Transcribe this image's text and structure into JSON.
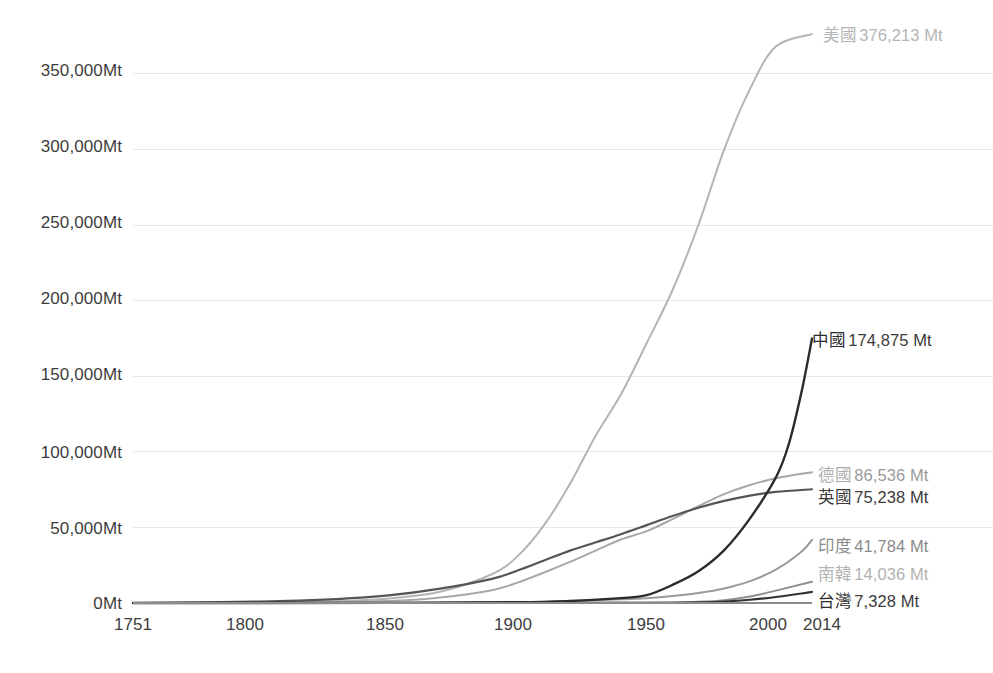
{
  "chart_data": {
    "type": "line",
    "title": "",
    "subtitle": "",
    "xlabel": "",
    "ylabel": "",
    "unit": "Mt",
    "xlim": [
      1751,
      2014
    ],
    "ylim": [
      0,
      380000
    ],
    "grid": true,
    "legend_position": "right-inline-end-labels",
    "y_ticks": [
      {
        "value": 0,
        "label": "0Mt"
      },
      {
        "value": 50000,
        "label": "50,000Mt"
      },
      {
        "value": 100000,
        "label": "100,000Mt"
      },
      {
        "value": 150000,
        "label": "150,000Mt"
      },
      {
        "value": 200000,
        "label": "200,000Mt"
      },
      {
        "value": 250000,
        "label": "250,000Mt"
      },
      {
        "value": 300000,
        "label": "300,000Mt"
      },
      {
        "value": 350000,
        "label": "350,000Mt"
      }
    ],
    "x_ticks": [
      {
        "value": 1751,
        "label": "1751"
      },
      {
        "value": 1800,
        "label": "1800"
      },
      {
        "value": 1850,
        "label": "1850"
      },
      {
        "value": 1900,
        "label": "1900"
      },
      {
        "value": 1950,
        "label": "1950"
      },
      {
        "value": 2000,
        "label": "2000"
      },
      {
        "value": 2014,
        "label": "2014"
      }
    ],
    "series": [
      {
        "name": "美國",
        "end_label_name": "美國",
        "end_label_value": "376,213 Mt",
        "final_value": 376213,
        "color": "#b4b4b4",
        "stroke_width": 2.0,
        "x": [
          1751,
          1800,
          1830,
          1850,
          1870,
          1890,
          1900,
          1910,
          1920,
          1930,
          1940,
          1950,
          1960,
          1970,
          1980,
          1990,
          2000,
          2014
        ],
        "values": [
          0,
          300,
          1200,
          3000,
          7500,
          19000,
          31000,
          51000,
          78000,
          110000,
          138000,
          172000,
          207000,
          250000,
          300000,
          340000,
          368000,
          376213
        ]
      },
      {
        "name": "中國",
        "end_label_name": "中國",
        "end_label_value": "174,875 Mt",
        "final_value": 174875,
        "color": "#2b2b2b",
        "stroke_width": 2.4,
        "x": [
          1751,
          1850,
          1900,
          1920,
          1940,
          1950,
          1960,
          1970,
          1980,
          1990,
          2000,
          2005,
          2010,
          2014
        ],
        "values": [
          0,
          80,
          500,
          1300,
          3200,
          5200,
          12000,
          21000,
          35000,
          56000,
          83000,
          105000,
          140000,
          174875
        ]
      },
      {
        "name": "德國",
        "end_label_name": "德國",
        "end_label_value": "86,536 Mt",
        "final_value": 86536,
        "color": "#a8a8a8",
        "stroke_width": 2.0,
        "x": [
          1751,
          1800,
          1850,
          1870,
          1890,
          1900,
          1910,
          1920,
          1930,
          1940,
          1950,
          1960,
          1970,
          1980,
          1990,
          2000,
          2014
        ],
        "values": [
          0,
          200,
          1400,
          3600,
          8500,
          13500,
          20000,
          27000,
          34500,
          42000,
          47500,
          55500,
          64000,
          72000,
          78000,
          82500,
          86536
        ]
      },
      {
        "name": "英國",
        "end_label_name": "英國",
        "end_label_value": "75,238 Mt",
        "final_value": 75238,
        "color": "#555555",
        "stroke_width": 2.2,
        "x": [
          1751,
          1800,
          1830,
          1850,
          1870,
          1890,
          1900,
          1910,
          1920,
          1930,
          1940,
          1950,
          1960,
          1970,
          1980,
          1990,
          2000,
          2014
        ],
        "values": [
          0,
          900,
          2600,
          5000,
          9500,
          16000,
          21500,
          28000,
          34500,
          40000,
          45500,
          51500,
          57500,
          63000,
          67500,
          71000,
          73500,
          75238
        ]
      },
      {
        "name": "印度",
        "end_label_name": "印度",
        "end_label_value": "41,784 Mt",
        "final_value": 41784,
        "color": "#9a9a9a",
        "stroke_width": 2.0,
        "x": [
          1751,
          1850,
          1900,
          1920,
          1940,
          1950,
          1960,
          1970,
          1980,
          1990,
          2000,
          2010,
          2014
        ],
        "values": [
          0,
          30,
          500,
          1200,
          2400,
          3200,
          4600,
          6600,
          9600,
          14500,
          22000,
          34000,
          41784
        ]
      },
      {
        "name": "南韓",
        "end_label_name": "南韓",
        "end_label_value": "14,036 Mt",
        "final_value": 14036,
        "color": "#8f8f8f",
        "stroke_width": 1.9,
        "x": [
          1751,
          1900,
          1940,
          1950,
          1960,
          1970,
          1980,
          1990,
          2000,
          2010,
          2014
        ],
        "values": [
          0,
          10,
          180,
          260,
          420,
          800,
          1900,
          4300,
          8200,
          12400,
          14036
        ]
      },
      {
        "name": "台灣",
        "end_label_name": "台灣",
        "end_label_value": "7,328 Mt",
        "final_value": 7328,
        "color": "#333333",
        "stroke_width": 2.1,
        "x": [
          1751,
          1900,
          1940,
          1950,
          1960,
          1970,
          1980,
          1990,
          2000,
          2010,
          2014
        ],
        "values": [
          0,
          5,
          70,
          110,
          190,
          400,
          950,
          2100,
          4000,
          6300,
          7328
        ]
      }
    ]
  },
  "labels": {
    "us_name": "美國",
    "us_value": "376,213 Mt",
    "cn_name": "中國",
    "cn_value": "174,875 Mt",
    "de_name": "德國",
    "de_value": "86,536 Mt",
    "uk_name": "英國",
    "uk_value": "75,238 Mt",
    "in_name": "印度",
    "in_value": "41,784 Mt",
    "kr_name": "南韓",
    "kr_value": "14,036 Mt",
    "tw_name": "台灣",
    "tw_value": "7,328 Mt"
  },
  "y_axis": {
    "t0": "0Mt",
    "t1": "50,000Mt",
    "t2": "100,000Mt",
    "t3": "150,000Mt",
    "t4": "200,000Mt",
    "t5": "250,000Mt",
    "t6": "300,000Mt",
    "t7": "350,000Mt"
  },
  "x_axis": {
    "t0": "1751",
    "t1": "1800",
    "t2": "1850",
    "t3": "1900",
    "t4": "1950",
    "t5": "2000",
    "t6": "2014"
  },
  "colors": {
    "grid": "#e8e8e8",
    "axis": "#8c8c8c",
    "tick_text": "#3d3d3d",
    "label_value_dark": "#3a3a3a",
    "label_value_light": "#b0b0b0"
  }
}
